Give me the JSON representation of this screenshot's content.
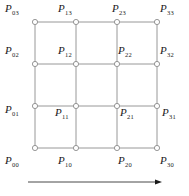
{
  "figure": {
    "title": "",
    "type": "control-point-lattice",
    "grid": {
      "columns": 4,
      "rows": 4,
      "col_x": [
        35,
        76,
        117,
        157
      ],
      "row_y": [
        22,
        64,
        106,
        148
      ],
      "line_color": "#8c8c8c",
      "node_fill": "#ffffff",
      "node_stroke": "#8c8c8c",
      "node_radius": 2.6
    },
    "nodes": [
      {
        "name": "P",
        "sub": "03",
        "col": 0,
        "row": 0,
        "label_x": 5,
        "label_y": 3,
        "label": "P03"
      },
      {
        "name": "P",
        "sub": "13",
        "col": 1,
        "row": 0,
        "label_x": 58,
        "label_y": 3,
        "label": "P13"
      },
      {
        "name": "P",
        "sub": "23",
        "col": 2,
        "row": 0,
        "label_x": 112,
        "label_y": 3,
        "label": "P23"
      },
      {
        "name": "P",
        "sub": "33",
        "col": 3,
        "row": 0,
        "label_x": 160,
        "label_y": 3,
        "label": "P33"
      },
      {
        "name": "P",
        "sub": "02",
        "col": 0,
        "row": 1,
        "label_x": 5,
        "label_y": 45,
        "label": "P02"
      },
      {
        "name": "P",
        "sub": "12",
        "col": 1,
        "row": 1,
        "label_x": 58,
        "label_y": 45,
        "label": "P12"
      },
      {
        "name": "P",
        "sub": "22",
        "col": 2,
        "row": 1,
        "label_x": 118,
        "label_y": 45,
        "label": "P22"
      },
      {
        "name": "P",
        "sub": "32",
        "col": 3,
        "row": 1,
        "label_x": 160,
        "label_y": 45,
        "label": "P32"
      },
      {
        "name": "P",
        "sub": "01",
        "col": 0,
        "row": 2,
        "label_x": 5,
        "label_y": 104,
        "label": "P01"
      },
      {
        "name": "P",
        "sub": "11",
        "col": 1,
        "row": 2,
        "label_x": 55,
        "label_y": 107,
        "label": "P11"
      },
      {
        "name": "P",
        "sub": "21",
        "col": 2,
        "row": 2,
        "label_x": 120,
        "label_y": 107,
        "label": "P21"
      },
      {
        "name": "P",
        "sub": "31",
        "col": 3,
        "row": 2,
        "label_x": 162,
        "label_y": 107,
        "label": "P31"
      },
      {
        "name": "P",
        "sub": "00",
        "col": 0,
        "row": 3,
        "label_x": 5,
        "label_y": 155,
        "label": "P00"
      },
      {
        "name": "P",
        "sub": "10",
        "col": 1,
        "row": 3,
        "label_x": 58,
        "label_y": 155,
        "label": "P10"
      },
      {
        "name": "P",
        "sub": "20",
        "col": 2,
        "row": 3,
        "label_x": 118,
        "label_y": 155,
        "label": "P20"
      },
      {
        "name": "P",
        "sub": "30",
        "col": 3,
        "row": 3,
        "label_x": 160,
        "label_y": 155,
        "label": "P30"
      }
    ],
    "arrow": {
      "name": "direction-arrow",
      "x1": 28,
      "x2": 162,
      "y": 182,
      "color": "#1a1a1a",
      "label": ""
    }
  }
}
